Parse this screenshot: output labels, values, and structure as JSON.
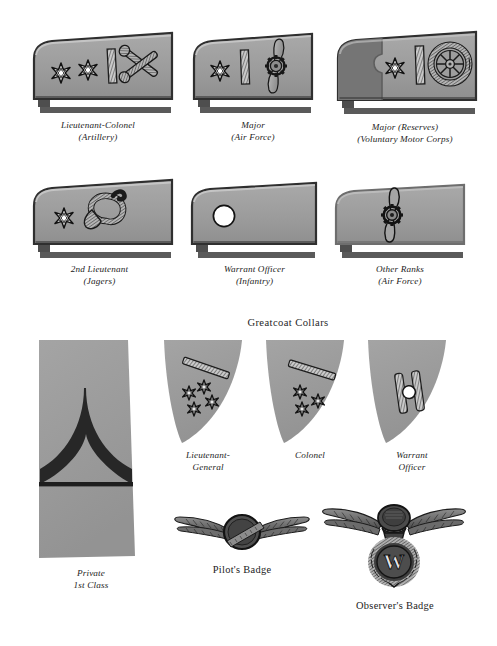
{
  "page": {
    "background": "#ffffff",
    "width": 497,
    "height": 646,
    "plate_type": "military-insignia-plate"
  },
  "palette": {
    "board_face": "#9a9a9a",
    "board_face_light": "#a6a6a6",
    "board_dark_panel": "#6f6f6f",
    "board_edge": "#3a3a3a",
    "board_shadow": "#555555",
    "collar_face": "#9d9d9d",
    "ink": "#1c1c1c",
    "star_fill": "#ffffff",
    "pip_fill": "#ffffff",
    "chevron_dark": "#2a2a2a"
  },
  "shoulder_boards": {
    "row1": [
      {
        "id": "lieutenant-colonel-artillery",
        "rank": "Lieutenant-Colonel",
        "branch": "(Artillery)",
        "stars": 2,
        "has_braid_bar": true,
        "device": "crossed-cannons",
        "style": "plain"
      },
      {
        "id": "major-air-force",
        "rank": "Major",
        "branch": "(Air Force)",
        "stars": 1,
        "has_braid_bar": true,
        "device": "winged-propeller",
        "style": "plain"
      },
      {
        "id": "major-reserves-voluntary-motor-corps",
        "rank": "Major (Reserves)",
        "branch": "(Voluntary Motor Corps)",
        "stars": 1,
        "has_braid_bar": true,
        "device": "steering-wheel",
        "style": "reserve-dark-panel"
      }
    ],
    "row2": [
      {
        "id": "2nd-lieutenant-jagers",
        "rank": "2nd Lieutenant",
        "branch": "(Jagers)",
        "stars": 1,
        "has_braid_bar": false,
        "device": "hunting-horn",
        "style": "plain"
      },
      {
        "id": "warrant-officer-infantry",
        "rank": "Warrant Officer",
        "branch": "(Infantry)",
        "stars": 0,
        "has_braid_bar": false,
        "device": "white-disc-pip",
        "style": "plain"
      },
      {
        "id": "other-ranks-air-force",
        "rank": "Other Ranks",
        "branch": "(Air Force)",
        "stars": 0,
        "has_braid_bar": false,
        "device": "winged-propeller",
        "style": "plain"
      }
    ]
  },
  "greatcoat": {
    "heading": "Greatcoat Collars",
    "collars": [
      {
        "id": "lieutenant-general",
        "rank_line1": "Lieutenant-",
        "rank_line2": "General",
        "stars": 4,
        "has_braid_bar": true
      },
      {
        "id": "colonel",
        "rank_line1": "Colonel",
        "rank_line2": "",
        "stars": 3,
        "has_braid_bar": true
      },
      {
        "id": "warrant-officer",
        "rank_line1": "Warrant",
        "rank_line2": "Officer",
        "stars": 0,
        "has_braid_bar": true,
        "device": "two-bars-with-disc"
      }
    ]
  },
  "sleeve_insignia": {
    "id": "private-1st-class",
    "rank_line1": "Private",
    "rank_line2": "1st Class",
    "device": "single-chevron-over-bar"
  },
  "badges": [
    {
      "id": "pilots-badge",
      "label": "Pilot's Badge",
      "device": "winged-oval"
    },
    {
      "id": "observers-badge",
      "label": "Observer's Badge",
      "device": "winged-eagle-over-wreath-w",
      "wreath_letter": "W"
    }
  ]
}
